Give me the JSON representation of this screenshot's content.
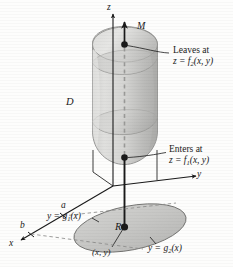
{
  "figure": {
    "kind": "math-3d-solid-region-diagram"
  },
  "axes": {
    "z_label": "z",
    "y_label": "y",
    "x_label": "x"
  },
  "labels": {
    "line_m": "M",
    "solid_d": "D",
    "region_r": "R",
    "point_xy": "(x, y)",
    "mark_a": "a",
    "mark_b": "b"
  },
  "annotations": {
    "leaves": {
      "line1": "Leaves at",
      "line2_lhs": "z = f",
      "line2_sub": "2",
      "line2_rhs": "(x, y)"
    },
    "enters": {
      "line1": "Enters at",
      "line2_lhs": "z = f",
      "line2_sub": "1",
      "line2_rhs": "(x, y)"
    }
  },
  "boundary_curves": {
    "g1": {
      "lhs": "y = g",
      "sub": "1",
      "rhs": "(x)"
    },
    "g2": {
      "lhs": "y = g",
      "sub": "2",
      "rhs": "(x)"
    }
  },
  "colors": {
    "ink": "#1a1a1a",
    "solid_light": "#d8d8d6",
    "solid_mid": "#c4c4c2",
    "solid_dark": "#b0b0ae",
    "solid_edge": "#8f8f8d",
    "region_fill": "#c9c9c7",
    "dashed": "#9a9a98",
    "page": "#fdfdfc"
  }
}
